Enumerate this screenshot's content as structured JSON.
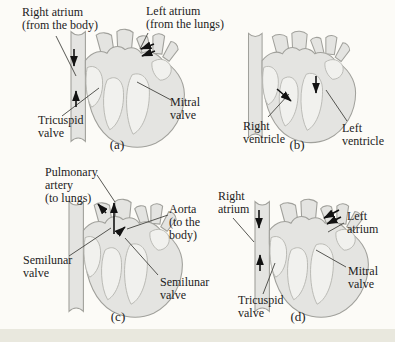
{
  "figure": {
    "panels": [
      {
        "caption": "(a)",
        "labels": [
          {
            "name": "right-atrium",
            "text": "Right atrium\n(from the body)"
          },
          {
            "name": "left-atrium",
            "text": "Left atrium\n(from the lungs)"
          },
          {
            "name": "tricuspid-valve",
            "text": "Tricuspid\nvalve"
          },
          {
            "name": "mitral-valve",
            "text": "Mitral\nvalve"
          }
        ]
      },
      {
        "caption": "(b)",
        "labels": [
          {
            "name": "right-ventricle",
            "text": "Right\nventricle"
          },
          {
            "name": "left-ventricle",
            "text": "Left\nventricle"
          }
        ]
      },
      {
        "caption": "(c)",
        "labels": [
          {
            "name": "pulmonary-artery",
            "text": "Pulmonary\nartery\n(to lungs)"
          },
          {
            "name": "aorta",
            "text": "Aorta\n(to the\nbody)"
          },
          {
            "name": "semilunar-valve-left",
            "text": "Semilunar\nvalve"
          },
          {
            "name": "semilunar-valve-right",
            "text": "Semilunar\nvalve"
          }
        ]
      },
      {
        "caption": "(d)",
        "labels": [
          {
            "name": "right-atrium",
            "text": "Right\natrium"
          },
          {
            "name": "left-atrium",
            "text": "Left\natrium"
          },
          {
            "name": "mitral-valve",
            "text": "Mitral\nvalve"
          },
          {
            "name": "tricuspid-valve",
            "text": "Tricuspid\nvalve"
          }
        ]
      }
    ],
    "colors": {
      "background": "#fcfbf7",
      "heart_fill": "#e4e4e1",
      "heart_cavity_fill": "#f1f1ee",
      "heart_outline": "#a0a09b",
      "cavity_outline": "#b4b4af",
      "leader_line": "#44443f",
      "arrow": "#121212",
      "text": "#1c1c1c",
      "bottom_strip": "#e9e8de"
    }
  }
}
